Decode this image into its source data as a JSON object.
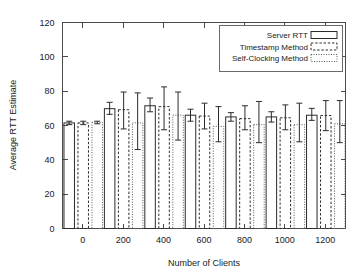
{
  "chart_data": {
    "type": "bar",
    "title": "",
    "subtitle": "",
    "xlabel": "Number of Clients",
    "ylabel": "Average RTT Estimate",
    "categories": [
      "0",
      "200",
      "400",
      "600",
      "800",
      "1000",
      "1200"
    ],
    "xlim": [
      -100,
      1300
    ],
    "ylim": [
      0,
      120
    ],
    "yticks": [
      "0",
      "20",
      "40",
      "60",
      "80",
      "100",
      "120"
    ],
    "ytick_values": [
      0,
      20,
      40,
      60,
      80,
      100,
      120
    ],
    "xticks": [
      "0",
      "200",
      "400",
      "600",
      "800",
      "1000",
      "1200"
    ],
    "xtick_values": [
      0,
      200,
      400,
      600,
      800,
      1000,
      1200
    ],
    "grid": false,
    "legend_position": "top-right",
    "error_bars": true,
    "series": [
      {
        "name": "Server RTT",
        "style": "solid",
        "values": [
          61.5,
          69.8,
          71.5,
          66.0,
          65.0,
          65.0,
          66.0
        ],
        "err_low": [
          60.5,
          66.5,
          68.0,
          62.5,
          62.5,
          62.0,
          63.0
        ],
        "err_high": [
          62.5,
          73.5,
          76.0,
          69.5,
          67.5,
          68.0,
          70.0
        ]
      },
      {
        "name": "Timestamp Method",
        "style": "dashed",
        "values": [
          61.5,
          69.2,
          71.0,
          65.5,
          64.0,
          64.5,
          65.8
        ],
        "err_low": [
          60.5,
          58.0,
          57.5,
          58.0,
          57.5,
          57.5,
          57.0
        ],
        "err_high": [
          62.5,
          79.5,
          82.5,
          73.0,
          71.5,
          72.0,
          74.5
        ]
      },
      {
        "name": "Self-Clocking Method",
        "style": "dotted",
        "values": [
          61.8,
          61.5,
          66.0,
          59.5,
          60.5,
          60.5,
          61.0
        ],
        "err_low": [
          61.0,
          46.0,
          51.5,
          50.5,
          50.0,
          50.5,
          50.0
        ],
        "err_high": [
          62.5,
          79.0,
          79.5,
          71.0,
          74.0,
          73.0,
          74.5
        ]
      }
    ]
  },
  "legend": {
    "items": [
      {
        "label": "Server RTT",
        "style": "solid"
      },
      {
        "label": "Timestamp Method",
        "style": "dashed"
      },
      {
        "label": "Self-Clocking Method",
        "style": "dotted"
      }
    ]
  },
  "colors": {
    "background": "#ffffff",
    "frame": "#4a4a4a",
    "text": "#1a1a1a",
    "bar_solid": "#2b2b2b",
    "bar_dashed": "#2b2b2b",
    "bar_dotted": "#5a5a5a"
  }
}
